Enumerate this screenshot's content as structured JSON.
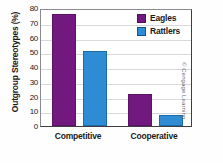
{
  "chart_data": {
    "type": "bar",
    "title": "",
    "xlabel": "",
    "ylabel": "Outgroup Stereotypes (%)",
    "categories": [
      "Competitive",
      "Cooperative"
    ],
    "series": [
      {
        "name": "Eagles",
        "color": "#72197f",
        "values": [
          76,
          21.5
        ]
      },
      {
        "name": "Rattlers",
        "color": "#2e8bd4",
        "values": [
          51,
          7.5
        ]
      }
    ],
    "ylim": [
      0,
      80
    ],
    "yticks": [
      0,
      10,
      20,
      30,
      40,
      50,
      60,
      70,
      80
    ],
    "ytick_labels": [
      "0",
      "10",
      "20",
      "30",
      "40",
      "50",
      "60",
      "70",
      "80"
    ],
    "grid": true,
    "legend_position": "top-right"
  },
  "credit": "© Cengage Learning"
}
